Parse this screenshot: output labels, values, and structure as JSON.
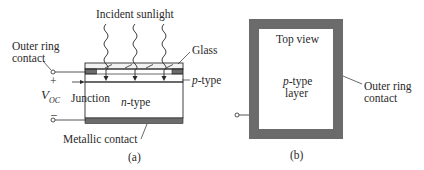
{
  "figure": {
    "panel_a": {
      "caption": "(a)",
      "labels": {
        "incident_sunlight": "Incident sunlight",
        "glass": "Glass",
        "outer_ring_contact_line1": "Outer ring",
        "outer_ring_contact_line2": "contact",
        "p_type_italic": "p",
        "p_type_suffix": "-type",
        "n_type_italic": "n",
        "n_type_suffix": "-type",
        "junction": "Junction",
        "voc_main": "V",
        "voc_sub": "OC",
        "plus": "+",
        "minus": "–",
        "metallic_contact": "Metallic contact"
      }
    },
    "panel_b": {
      "caption": "(b)",
      "labels": {
        "top_view": "Top view",
        "p_type_italic": "p",
        "p_type_suffix": "-type",
        "layer": "layer",
        "outer_ring_contact_line1": "Outer ring",
        "outer_ring_contact_line2": "contact"
      }
    },
    "colors": {
      "contact_gray": "#6b6b6b",
      "line": "#2a2a2a",
      "background": "#ffffff"
    }
  }
}
